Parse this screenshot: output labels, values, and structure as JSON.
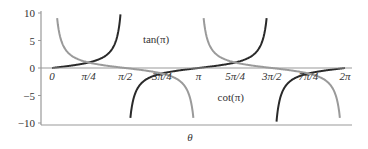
{
  "chart_data": {
    "type": "line",
    "title": "",
    "xlabel": "θ",
    "ylabel": "",
    "xlim": [
      0,
      6.2832
    ],
    "ylim": [
      -10,
      10
    ],
    "grid": false,
    "legend": "inline labels",
    "x_ticks": [
      {
        "value": 0,
        "label": "0"
      },
      {
        "value": 0.7854,
        "label": "π/4"
      },
      {
        "value": 1.5708,
        "label": "π/2"
      },
      {
        "value": 2.3562,
        "label": "3π/4"
      },
      {
        "value": 3.1416,
        "label": "π"
      },
      {
        "value": 3.927,
        "label": "5π/4"
      },
      {
        "value": 4.7124,
        "label": "3π/2"
      },
      {
        "value": 5.4978,
        "label": "7π/4"
      },
      {
        "value": 6.2832,
        "label": "2π"
      }
    ],
    "y_ticks": [
      {
        "value": 10,
        "label": "10"
      },
      {
        "value": 5,
        "label": "5"
      },
      {
        "value": 0,
        "label": "0"
      },
      {
        "value": -5,
        "label": "−5"
      },
      {
        "value": -10,
        "label": "−10"
      }
    ],
    "series": [
      {
        "name": "tan(π)",
        "function": "tan",
        "color": "#2a2a2a",
        "label_pos": [
          1.95,
          5.3
        ]
      },
      {
        "name": "cot(π)",
        "function": "cot",
        "color": "#9a9a9a",
        "label_pos": [
          3.55,
          -5.3
        ]
      }
    ],
    "annotations": [
      {
        "text": "tan(π)",
        "near": "right of tan branch at π/2, y≈5"
      },
      {
        "text": "cot(π)",
        "near": "right of cot branch at π, y≈-5"
      }
    ]
  },
  "axis_color": "#999999"
}
